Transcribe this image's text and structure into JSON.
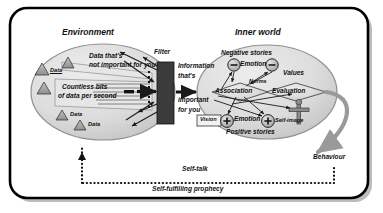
{
  "diagram": {
    "title_environment": "Environment",
    "title_inner_world": "Inner world",
    "filter_label": "Filter",
    "behaviour_label": "Behaviour",
    "self_talk_label": "Self-talk",
    "self_fulfilling_label": "Self-fulfilling prophecy",
    "environment": {
      "data_labels": [
        "Data",
        "Data",
        "Data"
      ],
      "not_important_line1": "Data that's",
      "not_important_line2": "not important for you",
      "countless_line1": "Countless bits",
      "countless_line2": "of data per second"
    },
    "gateway": {
      "info_line1": "Information",
      "info_line2": "that's",
      "info_line3": "important",
      "info_line4": "for you"
    },
    "inner_world": {
      "negative_stories": "Negative stories",
      "positive_stories": "Positive stories",
      "emotion_negative": "Emotion",
      "emotion_positive": "Emotion",
      "values": "Values",
      "norms": "Norms",
      "association": "Association",
      "evaluation": "Evaluation",
      "vision": "Vision",
      "self_image": "Self-image",
      "minus_sign": "−",
      "plus_sign": "+"
    }
  },
  "colors": {
    "border": "#000000",
    "ellipse_fill": "#d9d9d9",
    "ellipse_stroke": "#8a8a8a",
    "triangle_fill": "#a8a8a8",
    "triangle_stroke": "#3a3a3a",
    "node_fill": "#bdbdbd",
    "arrow": "#1a1a1a",
    "behaviour_arrow": "#9a9a9a",
    "shadow": "#bcbcbc"
  }
}
